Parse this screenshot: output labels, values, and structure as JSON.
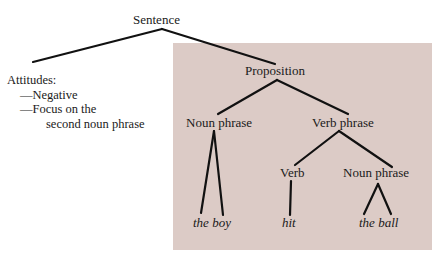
{
  "colors": {
    "panel_fill": "#dccbc6",
    "line": "#111111",
    "text": "#1a1a1a"
  },
  "tree": {
    "root": "Sentence",
    "attitudes": {
      "heading": "Attitudes:",
      "items": [
        "—Negative",
        "—Focus on the",
        "second noun phrase"
      ]
    },
    "proposition": "Proposition",
    "noun_phrase_1": "Noun phrase",
    "verb_phrase": "Verb phrase",
    "verb": "Verb",
    "noun_phrase_2": "Noun phrase",
    "leaves": {
      "the_boy": "the boy",
      "hit": "hit",
      "the_ball": "the ball"
    }
  }
}
